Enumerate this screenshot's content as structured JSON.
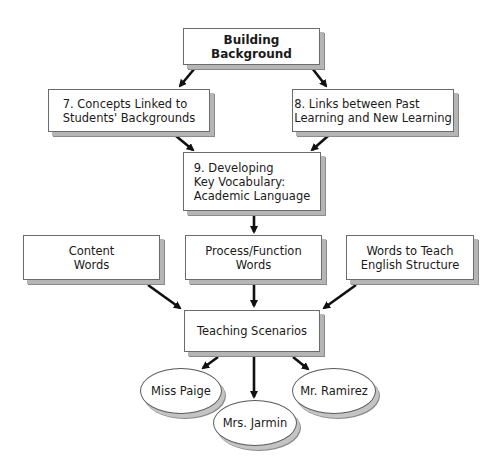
{
  "diagram": {
    "title": "Building Background",
    "nodes": {
      "building_background": "Building\nBackground",
      "concepts_linked": "7.  Concepts Linked to\n      Students' Backgrounds",
      "links_between": "8.  Links between Past\n      Learning and New Learning",
      "developing_vocab": "9.  Developing\n      Key Vocabulary:\n      Academic Language",
      "content_words": "Content\nWords",
      "process_function_words": "Process/Function\nWords",
      "english_structure_words": "Words to Teach\nEnglish Structure",
      "teaching_scenarios": "Teaching Scenarios",
      "miss_paige": "Miss Paige",
      "mrs_jarmin": "Mrs. Jarmin",
      "mr_ramirez": "Mr. Ramirez"
    },
    "edges": [
      [
        "building_background",
        "concepts_linked"
      ],
      [
        "building_background",
        "links_between"
      ],
      [
        "concepts_linked",
        "developing_vocab"
      ],
      [
        "links_between",
        "developing_vocab"
      ],
      [
        "developing_vocab",
        "process_function_words"
      ],
      [
        "content_words",
        "teaching_scenarios"
      ],
      [
        "process_function_words",
        "teaching_scenarios"
      ],
      [
        "english_structure_words",
        "teaching_scenarios"
      ],
      [
        "teaching_scenarios",
        "miss_paige"
      ],
      [
        "teaching_scenarios",
        "mrs_jarmin"
      ],
      [
        "teaching_scenarios",
        "mr_ramirez"
      ]
    ],
    "colors": {
      "border": "#6b6b6b",
      "shadow": "#b5b5b5",
      "arrow": "#111111",
      "fill": "#ffffff"
    }
  }
}
